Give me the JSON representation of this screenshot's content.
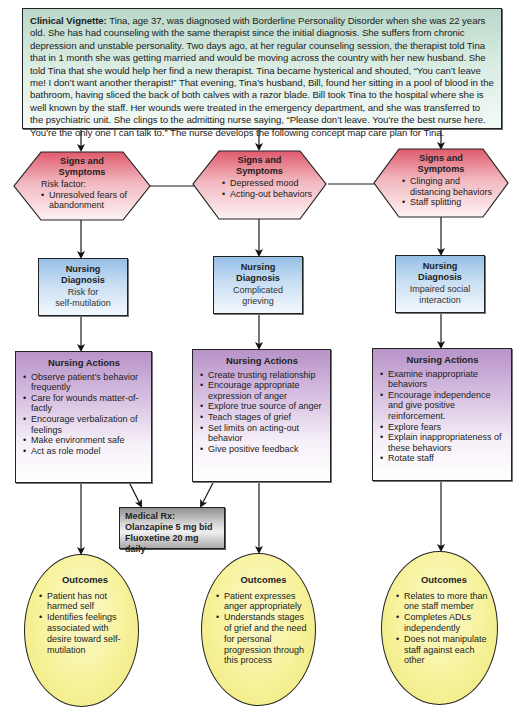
{
  "vignette": {
    "label": "Clinical Vignette:",
    "text": " Tina, age 37, was diagnosed with Borderline Personality Disorder when she was 22 years old. She has had counseling with the same therapist since the initial diagnosis. She suffers from chronic depression and unstable personality. Two days ago, at her regular counseling session, the therapist told Tina that in 1 month she was getting married and would be moving across the country with her new husband. She told Tina that she would help her find a new therapist. Tina became hysterical and shouted, “You can’t leave me! I don’t want another therapist!” That evening, Tina’s husband, Bill, found her sitting in a pool of blood in the bathroom, having sliced the back of both calves with a razor blade. Bill took Tina to the hospital where she is well known by the staff. Her wounds were treated in the emergency department, and she was transferred to the psychiatric unit. She clings to the admitting nurse saying, “Please don’t leave. You’re the best nurse here. You’re the only one I can talk to.” The nurse develops the following concept map care plan for Tina."
  },
  "colors": {
    "vignette_bg": "#b9d8c9",
    "signs_bg": "#e05c6e",
    "diagnosis_bg": "#95bfe6",
    "actions_bg": "#b893c9",
    "rx_bg": "#9a9a9a",
    "outcomes_bg": "#f7f29a",
    "line": "#222222"
  },
  "columns": [
    {
      "signs": {
        "title_line1": "Signs and",
        "title_line2": "Symptoms",
        "intro": "Risk factor:",
        "items": [
          "Unresolved fears of abandonment"
        ]
      },
      "diagnosis": {
        "title_line1": "Nursing",
        "title_line2": "Diagnosis",
        "line1": "Risk for",
        "line2": "self-mutilation"
      },
      "actions": {
        "title": "Nursing Actions",
        "items": [
          "Observe patient’s behavior frequently",
          "Care for wounds matter-of-factly",
          "Encourage verbalization of feelings",
          "Make environment safe",
          "Act as role model"
        ]
      },
      "outcomes": {
        "title": "Outcomes",
        "items": [
          "Patient has not harmed self",
          "Identifies feelings associated with desire toward self-mutilation"
        ]
      }
    },
    {
      "signs": {
        "title_line1": "Signs and",
        "title_line2": "Symptoms",
        "intro": "",
        "items": [
          "Depressed mood",
          "Acting-out behaviors"
        ]
      },
      "diagnosis": {
        "title_line1": "Nursing",
        "title_line2": "Diagnosis",
        "line1": "Complicated",
        "line2": "grieving"
      },
      "actions": {
        "title": "Nursing Actions",
        "items": [
          "Create trusting relationship",
          "Encourage appropriate expression of anger",
          "Explore true source of anger",
          "Teach stages of grief",
          "Set limits on acting-out behavior",
          "Give positive feedback"
        ]
      },
      "outcomes": {
        "title": "Outcomes",
        "items": [
          "Patient expresses anger appropriately",
          "Understands stages of grief and the need for personal progression through this process"
        ]
      }
    },
    {
      "signs": {
        "title_line1": "Signs and",
        "title_line2": "Symptoms",
        "intro": "",
        "items": [
          "Clinging and distancing behaviors",
          "Staff splitting"
        ]
      },
      "diagnosis": {
        "title_line1": "Nursing",
        "title_line2": "Diagnosis",
        "line1": "Impaired social",
        "line2": "interaction"
      },
      "actions": {
        "title": "Nursing Actions",
        "items": [
          "Examine inappropriate behaviors",
          "Encourage independence and give positive reinforcement.",
          "Explore fears",
          "Explain inappropriateness of these behaviors",
          "Rotate staff"
        ]
      },
      "outcomes": {
        "title": "Outcomes",
        "items": [
          "Relates to more than one staff member",
          "Completes ADLs independently",
          "Does not manipulate staff against each other"
        ]
      }
    }
  ],
  "medical_rx": {
    "title": "Medical Rx:",
    "lines": [
      "Olanzapine 5 mg bid",
      "Fluoxetine 20 mg daily"
    ]
  }
}
